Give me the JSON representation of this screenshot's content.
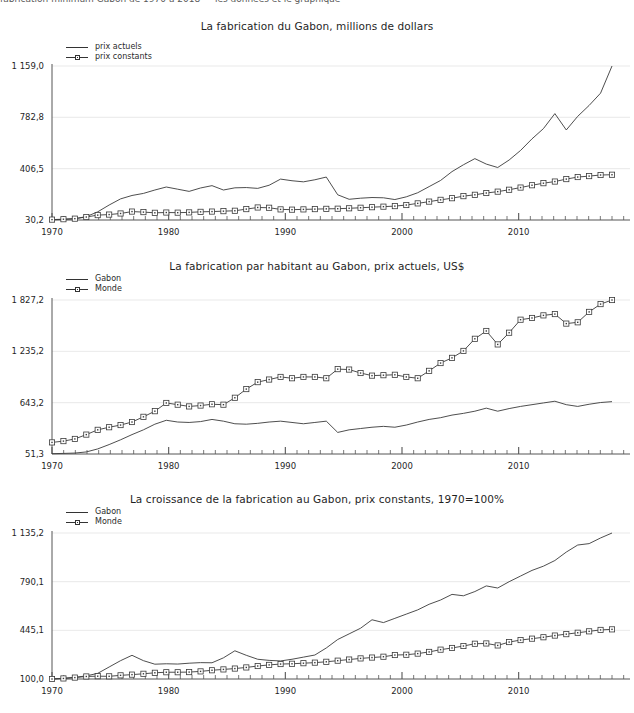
{
  "header": {
    "clipped_text": "fabrication minimum  Gabon de 1970 a 2018 — les donnees et le graphique"
  },
  "charts": [
    {
      "id": "chart-manufacturing-total",
      "title": "La fabrication du Gabon, millions de dollars",
      "legend": [
        {
          "label": "prix actuels",
          "marker": "line"
        },
        {
          "label": "prix constants",
          "marker": "line-square"
        }
      ]
    },
    {
      "id": "chart-manufacturing-per-capita",
      "title": "La fabrication par habitant au Gabon, prix actuels, US$",
      "legend": [
        {
          "label": "Gabon",
          "marker": "line"
        },
        {
          "label": "Monde",
          "marker": "line-square"
        }
      ]
    },
    {
      "id": "chart-manufacturing-growth",
      "title": "La croissance de la fabrication au Gabon, prix constants, 1970=100%",
      "legend": [
        {
          "label": "Gabon",
          "marker": "line"
        },
        {
          "label": "Monde",
          "marker": "line-square"
        }
      ]
    }
  ],
  "chart_data": [
    {
      "type": "line",
      "title": "La fabrication du Gabon, millions de dollars",
      "xlabel": "",
      "ylabel": "",
      "xlim": [
        1970,
        2018
      ],
      "ylim": [
        30.2,
        1159.0
      ],
      "yticks": [
        30.2,
        406.5,
        782.8,
        1159.0
      ],
      "ytick_labels": [
        "30,2",
        "406,5",
        "782,8",
        "1 159,0"
      ],
      "xticks": [
        1970,
        1980,
        1990,
        2000,
        2010
      ],
      "xtick_labels": [
        "1970",
        "1980",
        "1990",
        "2000",
        "2010"
      ],
      "grid": true,
      "legend_position": "top-left",
      "x": [
        1970,
        1971,
        1972,
        1973,
        1974,
        1975,
        1976,
        1977,
        1978,
        1979,
        1980,
        1981,
        1982,
        1983,
        1984,
        1985,
        1986,
        1987,
        1988,
        1989,
        1990,
        1991,
        1992,
        1993,
        1994,
        1995,
        1996,
        1997,
        1998,
        1999,
        2000,
        2001,
        2002,
        2003,
        2004,
        2005,
        2006,
        2007,
        2008,
        2009,
        2010,
        2011,
        2012,
        2013,
        2014,
        2015,
        2016,
        2017,
        2018
      ],
      "series": [
        {
          "name": "prix actuels",
          "values": [
            32,
            35,
            40,
            55,
            90,
            140,
            185,
            210,
            225,
            250,
            272,
            256,
            240,
            265,
            282,
            250,
            266,
            268,
            262,
            285,
            330,
            318,
            310,
            325,
            345,
            215,
            182,
            190,
            195,
            193,
            180,
            200,
            230,
            275,
            320,
            385,
            435,
            480,
            440,
            415,
            470,
            540,
            625,
            700,
            810,
            690,
            790,
            870,
            960,
            1159
          ]
        },
        {
          "name": "prix constants",
          "values": [
            33,
            36,
            40,
            52,
            66,
            70,
            78,
            92,
            88,
            83,
            85,
            84,
            86,
            90,
            92,
            95,
            98,
            110,
            122,
            120,
            108,
            106,
            108,
            110,
            112,
            113,
            116,
            120,
            124,
            128,
            132,
            140,
            152,
            165,
            178,
            190,
            205,
            215,
            228,
            238,
            252,
            268,
            285,
            300,
            312,
            330,
            345,
            352,
            360,
            362
          ]
        }
      ]
    },
    {
      "type": "line",
      "title": "La fabrication par habitant au Gabon, prix actuels, US$",
      "xlabel": "",
      "ylabel": "",
      "xlim": [
        1970,
        2018
      ],
      "ylim": [
        51.3,
        1827.2
      ],
      "yticks": [
        51.3,
        643.2,
        1235.2,
        1827.2
      ],
      "ytick_labels": [
        "51,3",
        "643,2",
        "1 235,2",
        "1 827,2"
      ],
      "xticks": [
        1970,
        1980,
        1990,
        2000,
        2010
      ],
      "xtick_labels": [
        "1970",
        "1980",
        "1990",
        "2000",
        "2010"
      ],
      "grid": true,
      "legend_position": "top-left",
      "x": [
        1970,
        1971,
        1972,
        1973,
        1974,
        1975,
        1976,
        1977,
        1978,
        1979,
        1980,
        1981,
        1982,
        1983,
        1984,
        1985,
        1986,
        1987,
        1988,
        1989,
        1990,
        1991,
        1992,
        1993,
        1994,
        1995,
        1996,
        1997,
        1998,
        1999,
        2000,
        2001,
        2002,
        2003,
        2004,
        2005,
        2006,
        2007,
        2008,
        2009,
        2010,
        2011,
        2012,
        2013,
        2014,
        2015,
        2016,
        2017,
        2018
      ],
      "series": [
        {
          "name": "Gabon",
          "values": [
            55,
            58,
            62,
            75,
            110,
            160,
            215,
            275,
            330,
            395,
            440,
            420,
            415,
            425,
            450,
            430,
            400,
            395,
            405,
            420,
            430,
            415,
            400,
            415,
            430,
            300,
            330,
            345,
            360,
            370,
            360,
            385,
            420,
            450,
            470,
            500,
            520,
            545,
            580,
            545,
            575,
            600,
            620,
            640,
            660,
            620,
            600,
            625,
            645,
            655
          ]
        },
        {
          "name": "Monde",
          "values": [
            185,
            200,
            225,
            275,
            330,
            360,
            385,
            420,
            480,
            545,
            640,
            620,
            600,
            610,
            625,
            620,
            700,
            800,
            880,
            910,
            940,
            925,
            940,
            940,
            925,
            1030,
            1025,
            985,
            955,
            960,
            965,
            940,
            925,
            1010,
            1100,
            1160,
            1240,
            1380,
            1470,
            1315,
            1450,
            1600,
            1620,
            1650,
            1665,
            1555,
            1570,
            1690,
            1780,
            1827
          ]
        }
      ]
    },
    {
      "type": "line",
      "title": "La croissance de la fabrication au Gabon, prix constants, 1970=100%",
      "xlabel": "",
      "ylabel": "",
      "xlim": [
        1970,
        2018
      ],
      "ylim": [
        100.0,
        1135.2
      ],
      "yticks": [
        100.0,
        445.1,
        790.1,
        1135.2
      ],
      "ytick_labels": [
        "100,0",
        "445,1",
        "790,1",
        "1 135,2"
      ],
      "xticks": [
        1970,
        1980,
        1990,
        2000,
        2010
      ],
      "xtick_labels": [
        "1970",
        "1980",
        "1990",
        "2000",
        "2010"
      ],
      "grid": true,
      "legend_position": "top-left",
      "x": [
        1970,
        1971,
        1972,
        1973,
        1974,
        1975,
        1976,
        1977,
        1978,
        1979,
        1980,
        1981,
        1982,
        1983,
        1984,
        1985,
        1986,
        1987,
        1988,
        1989,
        1990,
        1991,
        1992,
        1993,
        1994,
        1995,
        1996,
        1997,
        1998,
        1999,
        2000,
        2001,
        2002,
        2003,
        2004,
        2005,
        2006,
        2007,
        2008,
        2009,
        2010,
        2011,
        2012,
        2013,
        2014,
        2015,
        2016,
        2017,
        2018
      ],
      "series": [
        {
          "name": "Gabon",
          "values": [
            100,
            105,
            112,
            122,
            140,
            185,
            230,
            268,
            230,
            205,
            208,
            206,
            212,
            216,
            215,
            250,
            300,
            268,
            240,
            232,
            228,
            240,
            255,
            270,
            320,
            380,
            420,
            460,
            520,
            500,
            530,
            560,
            590,
            630,
            660,
            700,
            690,
            720,
            760,
            745,
            790,
            830,
            870,
            900,
            940,
            1000,
            1050,
            1060,
            1100,
            1135
          ]
        },
        {
          "name": "Monde",
          "values": [
            100,
            104,
            110,
            118,
            120,
            119,
            126,
            131,
            137,
            144,
            148,
            148,
            149,
            154,
            162,
            168,
            174,
            182,
            192,
            200,
            206,
            208,
            212,
            216,
            222,
            230,
            238,
            246,
            252,
            258,
            270,
            272,
            280,
            292,
            308,
            320,
            334,
            350,
            352,
            338,
            362,
            376,
            386,
            396,
            408,
            418,
            428,
            438,
            448,
            452
          ]
        }
      ]
    }
  ]
}
